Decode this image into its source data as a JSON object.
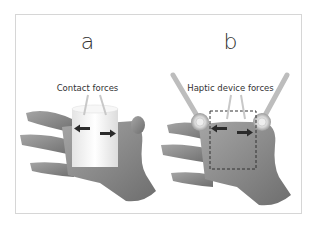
{
  "figure": {
    "panels": [
      {
        "label": "a",
        "caption": "Contact forces",
        "description": "Hand grasping a white cylinder with two arrows showing contact forces"
      },
      {
        "label": "b",
        "caption": "Haptic device forces",
        "description": "Hand with two haptic device thimbles on fingers; dashed outline of virtual object and force arrows"
      }
    ],
    "colors": {
      "frame": "#d6d6d6",
      "hand": "#8a8a8a",
      "object": "#f2f2f2",
      "arrow": "#2a2a2a",
      "pointer": "#d0d0d0",
      "device_rod": "#bdbdbd",
      "dashed_box": "#333333"
    }
  }
}
